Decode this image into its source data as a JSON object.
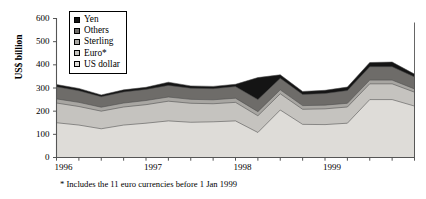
{
  "chart_data": {
    "type": "area",
    "title": "",
    "subtitle": "",
    "xlabel": "",
    "ylabel": "US$ billion",
    "ylim": [
      0,
      600
    ],
    "yticks": [
      0,
      100,
      200,
      300,
      400,
      500,
      600
    ],
    "ytick_labels": [
      "0",
      "100",
      "200",
      "300",
      "400",
      "500",
      "600"
    ],
    "xtick_labels": [
      "1996",
      "1997",
      "1998",
      "1999"
    ],
    "x_minor_ticks_per_year": 4,
    "grid": false,
    "legend_position": "top-left",
    "stacked": true,
    "annotation": "* Includes the 11 euro currencies before 1 Jan 1999",
    "x": [
      "1996Q1",
      "1996Q2",
      "1996Q3",
      "1996Q4",
      "1997Q1",
      "1997Q2",
      "1997Q3",
      "1997Q4",
      "1998Q1",
      "1998Q2",
      "1998Q3",
      "1998Q4",
      "1999Q1",
      "1999Q2",
      "1999Q3",
      "1999Q4",
      "2000Q1"
    ],
    "series": [
      {
        "name": "US dollar",
        "color": "#dedcd8",
        "values": [
          150,
          140,
          124,
          140,
          148,
          158,
          152,
          154,
          158,
          108,
          205,
          143,
          142,
          148,
          250,
          250,
          222
        ]
      },
      {
        "name": "Euro*",
        "color": "#c5c3bf",
        "values": [
          85,
          80,
          76,
          78,
          80,
          85,
          82,
          78,
          80,
          72,
          70,
          65,
          68,
          70,
          68,
          68,
          60
        ]
      },
      {
        "name": "Sterling",
        "color": "#a8a6a2",
        "values": [
          18,
          18,
          17,
          17,
          18,
          18,
          17,
          17,
          18,
          18,
          17,
          16,
          16,
          16,
          16,
          16,
          14
        ]
      },
      {
        "name": "Others",
        "color": "#6e6c69",
        "values": [
          52,
          50,
          45,
          48,
          48,
          50,
          48,
          48,
          50,
          52,
          50,
          48,
          50,
          55,
          58,
          58,
          52
        ]
      },
      {
        "name": "Yen",
        "color": "#141414",
        "values": [
          10,
          10,
          8,
          9,
          9,
          14,
          10,
          10,
          10,
          95,
          15,
          13,
          14,
          15,
          18,
          20,
          12
        ]
      }
    ],
    "totals": [
      315,
      298,
      270,
      292,
      303,
      325,
      309,
      307,
      316,
      345,
      357,
      285,
      290,
      304,
      410,
      412,
      360
    ]
  },
  "legend": {
    "items": [
      {
        "label": "Yen",
        "color": "#141414"
      },
      {
        "label": "Others",
        "color": "#6e6c69"
      },
      {
        "label": "Sterling",
        "color": "#a8a6a2"
      },
      {
        "label": "Euro*",
        "color": "#c5c3bf"
      },
      {
        "label": "US dollar",
        "color": "#dedcd8"
      }
    ]
  }
}
